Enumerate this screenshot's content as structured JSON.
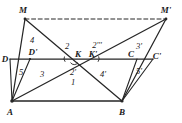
{
  "figure": {
    "width": 182,
    "height": 123,
    "stroke_color": "#262626",
    "text_color": "#1a1a1a",
    "background": "#ffffff"
  },
  "vertices": [
    {
      "id": "M",
      "label": "M",
      "x": 25,
      "y": 19,
      "lx": 23,
      "ly": 10
    },
    {
      "id": "Mp",
      "label": "M'",
      "x": 166,
      "y": 19,
      "lx": 165,
      "ly": 10
    },
    {
      "id": "D",
      "label": "D",
      "x": 10,
      "y": 59,
      "lx": 6,
      "ly": 59
    },
    {
      "id": "Dp",
      "label": "D'",
      "x": 30,
      "y": 59,
      "lx": 32,
      "ly": 53
    },
    {
      "id": "K",
      "label": "K",
      "x": 74,
      "y": 59,
      "lx": 77,
      "ly": 54
    },
    {
      "id": "Kp",
      "label": "K'",
      "x": 88,
      "y": 59,
      "lx": 92,
      "ly": 54
    },
    {
      "id": "C",
      "label": "C",
      "x": 137,
      "y": 59,
      "lx": 131,
      "ly": 54
    },
    {
      "id": "Cp",
      "label": "C'",
      "x": 153,
      "y": 59,
      "lx": 157,
      "ly": 56
    },
    {
      "id": "A",
      "label": "A",
      "x": 12,
      "y": 101,
      "lx": 10,
      "ly": 112
    },
    {
      "id": "B",
      "label": "B",
      "x": 122,
      "y": 101,
      "lx": 122,
      "ly": 112
    }
  ],
  "region_labels": [
    {
      "label": "4",
      "x": 32,
      "y": 40
    },
    {
      "label": "2",
      "x": 67,
      "y": 46
    },
    {
      "label": "2'''",
      "x": 97,
      "y": 45
    },
    {
      "label": "3'",
      "x": 139,
      "y": 46
    },
    {
      "label": "5",
      "x": 21,
      "y": 72
    },
    {
      "label": "3",
      "x": 42,
      "y": 74
    },
    {
      "label": "2'",
      "x": 73,
      "y": 72
    },
    {
      "label": "1",
      "x": 73,
      "y": 82
    },
    {
      "label": "4'",
      "x": 103,
      "y": 74
    },
    {
      "label": "5'",
      "x": 139,
      "y": 71
    }
  ],
  "segments": [
    {
      "name": "M-to-Mprime-dashed",
      "from": "M",
      "to": "Mp",
      "style": "dashed"
    },
    {
      "name": "D-to-Cprime-base",
      "from": "D",
      "to": "Cp",
      "style": "solid"
    },
    {
      "name": "A-to-B-base",
      "from": "A",
      "to": "B",
      "style": "solid"
    },
    {
      "name": "M-to-A",
      "from": "M",
      "to": "A",
      "style": "solid"
    },
    {
      "name": "M-to-B",
      "from": "M",
      "to": "B",
      "style": "solid"
    },
    {
      "name": "Mprime-to-A",
      "from": "Mp",
      "to": "A",
      "style": "solid"
    },
    {
      "name": "Mprime-to-B",
      "from": "Mp",
      "to": "B",
      "style": "solid"
    },
    {
      "name": "A-to-D",
      "from": "A",
      "to": "D",
      "style": "solid"
    },
    {
      "name": "A-to-Dprime",
      "from": "A",
      "to": "Dp",
      "style": "solid"
    },
    {
      "name": "B-to-C",
      "from": "B",
      "to": "C",
      "style": "solid"
    },
    {
      "name": "B-to-Cprime",
      "from": "B",
      "to": "Cp",
      "style": "solid"
    }
  ],
  "angle_arcs": [
    {
      "name": "arc-at-K-left",
      "x": 68,
      "y": 59
    },
    {
      "name": "arc-at-Kprime",
      "x": 95,
      "y": 59
    },
    {
      "name": "arc-below-K",
      "x": 74,
      "y": 64
    }
  ]
}
